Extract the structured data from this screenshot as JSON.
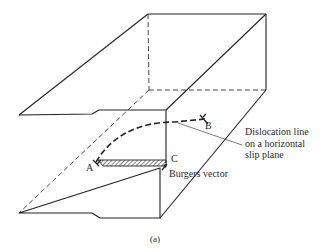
{
  "figure": {
    "caption": "(a)",
    "points": {
      "a": "A",
      "b": "B",
      "c": "C"
    },
    "annotations": {
      "dislocation_line": [
        "Dislocation line",
        "on a horizontal",
        "slip plane"
      ],
      "burgers_vector": "Burgers vector"
    },
    "colors": {
      "line": "#222222",
      "background": "#ffffff"
    }
  }
}
